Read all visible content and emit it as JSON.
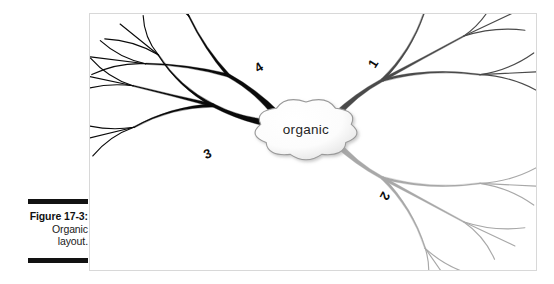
{
  "figure": {
    "caption_number": "Figure 17-3:",
    "caption_lines": [
      "Organic",
      "layout."
    ],
    "frame": {
      "x": 89,
      "y": 13,
      "width": 448,
      "height": 258,
      "border_color": "#d8d8d8"
    }
  },
  "diagram": {
    "type": "mind-map",
    "layout_style": "organic",
    "center": {
      "label": "organic",
      "shape": "cloud",
      "cx": 216,
      "cy": 115,
      "fill": "#ffffff",
      "stroke": "#9a9a9a",
      "text_color": "#242424"
    },
    "background": "#ffffff",
    "branch_count": 4,
    "branches": [
      {
        "id": 1,
        "label": "1",
        "direction": "upper-right",
        "color": "#4a4a4a",
        "trunk_width": 7,
        "label_x": 287,
        "label_y": 52,
        "label_rotation": -58,
        "sub_branches": 3,
        "twigs_per_sub_branch": 3
      },
      {
        "id": 2,
        "label": "2",
        "direction": "lower-right",
        "color": "#a8a8a8",
        "trunk_width": 7,
        "label_x": 291,
        "label_y": 180,
        "label_rotation": 118,
        "sub_branches": 3,
        "twigs_per_sub_branch": 3
      },
      {
        "id": 3,
        "label": "3",
        "direction": "lower-left",
        "color": "#0a0a0a",
        "trunk_width": 8,
        "label_x": 119,
        "label_y": 144,
        "label_rotation": -22,
        "sub_branches": 3,
        "twigs_per_sub_branch": 3
      },
      {
        "id": 4,
        "label": "4",
        "direction": "upper-left",
        "color": "#0a0a0a",
        "trunk_width": 8,
        "label_x": 171,
        "label_y": 57,
        "label_rotation": -32,
        "sub_branches": 2,
        "twigs_per_sub_branch": 3
      }
    ]
  }
}
